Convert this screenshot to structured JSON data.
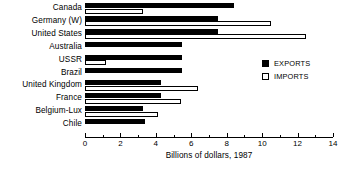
{
  "chart_data": {
    "type": "bar",
    "orientation": "horizontal",
    "title": "",
    "xlabel": "Billions of dollars, 1987",
    "ylabel": "",
    "xlim": [
      0,
      14
    ],
    "xticks": [
      0,
      2,
      4,
      6,
      8,
      10,
      12,
      14
    ],
    "xticklabels": [
      "0",
      "2",
      "4",
      "6",
      "8",
      "10",
      "12",
      "14"
    ],
    "minor_xticks": [
      1,
      3,
      5,
      7,
      9,
      11,
      13
    ],
    "grid": false,
    "legend_position": "right-middle",
    "categories": [
      "Canada",
      "Germany (W)",
      "United States",
      "Australia",
      "USSR",
      "Brazil",
      "United Kingdom",
      "France",
      "Belgium-Lux",
      "Chile"
    ],
    "series": [
      {
        "name": "EXPORTS",
        "color": "#000000",
        "values": [
          8.4,
          7.5,
          7.5,
          5.5,
          5.5,
          5.5,
          4.3,
          4.3,
          3.3,
          3.4
        ]
      },
      {
        "name": "IMPORTS",
        "color": "#ffffff",
        "values": [
          3.3,
          10.5,
          12.5,
          0,
          1.2,
          0,
          6.4,
          5.4,
          4.1,
          0
        ]
      }
    ]
  },
  "legend": {
    "items": [
      {
        "label": "EXPORTS",
        "swatch": "filled"
      },
      {
        "label": "IMPORTS",
        "swatch": "hollow"
      }
    ]
  },
  "axis": {
    "title": "Billions of dollars, 1987"
  }
}
